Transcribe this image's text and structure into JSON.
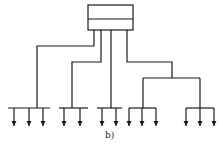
{
  "diagram": {
    "caption": "b)",
    "type": "tree distribution layout",
    "source_box": {
      "sections": 2
    },
    "branches": [
      {
        "id": 1,
        "outlets": 3
      },
      {
        "id": 2,
        "outlets": 2
      },
      {
        "id": 3,
        "outlets": 2
      },
      {
        "id": 4,
        "sub_branches": [
          {
            "outlets": 3
          },
          {
            "outlets": 3
          }
        ]
      }
    ],
    "colors": {
      "line": "#1a1a1a",
      "background": "#ffffff"
    }
  }
}
